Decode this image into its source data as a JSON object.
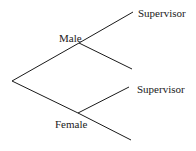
{
  "diagram": {
    "type": "tree-diagram",
    "line_color": "#1a1a1a",
    "nodes": {
      "root": {
        "x": 12,
        "y": 81
      },
      "male": {
        "x": 79,
        "y": 43,
        "label": "Male"
      },
      "female": {
        "x": 78,
        "y": 113,
        "label": "Female"
      }
    },
    "branches": [
      {
        "from": "root",
        "to": "male"
      },
      {
        "from": "root",
        "to": "female"
      },
      {
        "from": "male",
        "to_point": [
          133,
          12
        ],
        "label": "Supervisor"
      },
      {
        "from": "male",
        "to_point": [
          132,
          69
        ],
        "label": ""
      },
      {
        "from": "female",
        "to_point": [
          129,
          87
        ],
        "label": "Supervisor"
      },
      {
        "from": "female",
        "to_point": [
          131,
          140
        ],
        "label": ""
      }
    ],
    "labels": {
      "male": "Male",
      "female": "Female",
      "male_supervisor": "Supervisor",
      "female_supervisor": "Supervisor"
    }
  }
}
